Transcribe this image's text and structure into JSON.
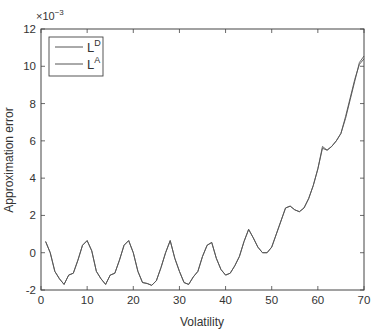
{
  "chart_data": {
    "type": "line",
    "title": "",
    "xlabel": "Volatility",
    "ylabel": "Approximation error",
    "y_multiplier_label": {
      "base": "×10",
      "exponent": "−3"
    },
    "xlim": [
      0,
      70
    ],
    "ylim": [
      -2,
      12
    ],
    "xticks": [
      0,
      10,
      20,
      30,
      40,
      50,
      60,
      70
    ],
    "yticks": [
      -2,
      0,
      2,
      4,
      6,
      8,
      10,
      12
    ],
    "grid": false,
    "legend_position": "top-left",
    "line_color": "#555555",
    "series": [
      {
        "name": "L",
        "superscript": "D",
        "x": [
          1,
          2,
          3,
          4,
          5,
          6,
          7,
          8,
          9,
          10,
          11,
          12,
          13,
          14,
          15,
          16,
          17,
          18,
          19,
          20,
          21,
          22,
          23,
          24,
          25,
          26,
          27,
          28,
          29,
          30,
          31,
          32,
          33,
          34,
          35,
          36,
          37,
          38,
          39,
          40,
          41,
          42,
          43,
          44,
          45,
          46,
          47,
          48,
          49,
          50,
          51,
          52,
          53,
          54,
          55,
          56,
          57,
          58,
          59,
          60,
          61,
          62,
          63,
          64,
          65,
          66,
          67,
          68,
          69,
          70
        ],
        "y": [
          0.6,
          0.0,
          -1.0,
          -1.4,
          -1.7,
          -1.2,
          -1.1,
          -0.4,
          0.4,
          0.65,
          0.1,
          -1.0,
          -1.4,
          -1.7,
          -1.2,
          -1.1,
          -0.4,
          0.4,
          0.65,
          0.0,
          -1.0,
          -1.6,
          -1.65,
          -1.75,
          -1.5,
          -0.8,
          0.0,
          0.65,
          -0.3,
          -1.0,
          -1.6,
          -1.7,
          -1.3,
          -1.0,
          -0.2,
          0.4,
          0.55,
          -0.3,
          -0.9,
          -1.2,
          -1.1,
          -0.7,
          -0.2,
          0.6,
          1.25,
          0.8,
          0.3,
          0.0,
          0.0,
          0.3,
          1.0,
          1.7,
          2.4,
          2.5,
          2.3,
          2.2,
          2.4,
          2.9,
          3.6,
          4.5,
          5.6,
          5.5,
          5.7,
          6.0,
          6.4,
          7.3,
          8.3,
          9.3,
          10.1,
          10.4
        ]
      },
      {
        "name": "L",
        "superscript": "A",
        "x": [
          1,
          2,
          3,
          4,
          5,
          6,
          7,
          8,
          9,
          10,
          11,
          12,
          13,
          14,
          15,
          16,
          17,
          18,
          19,
          20,
          21,
          22,
          23,
          24,
          25,
          26,
          27,
          28,
          29,
          30,
          31,
          32,
          33,
          34,
          35,
          36,
          37,
          38,
          39,
          40,
          41,
          42,
          43,
          44,
          45,
          46,
          47,
          48,
          49,
          50,
          51,
          52,
          53,
          54,
          55,
          56,
          57,
          58,
          59,
          60,
          61,
          62,
          63,
          64,
          65,
          66,
          67,
          68,
          69,
          70
        ],
        "y": [
          0.6,
          0.0,
          -1.0,
          -1.4,
          -1.7,
          -1.2,
          -1.1,
          -0.4,
          0.4,
          0.65,
          0.1,
          -1.0,
          -1.4,
          -1.7,
          -1.2,
          -1.1,
          -0.4,
          0.4,
          0.65,
          0.0,
          -1.0,
          -1.6,
          -1.65,
          -1.75,
          -1.5,
          -0.8,
          0.0,
          0.65,
          -0.3,
          -1.0,
          -1.6,
          -1.7,
          -1.3,
          -1.0,
          -0.2,
          0.4,
          0.55,
          -0.3,
          -0.9,
          -1.2,
          -1.1,
          -0.7,
          -0.2,
          0.6,
          1.25,
          0.8,
          0.3,
          0.0,
          0.0,
          0.3,
          1.0,
          1.7,
          2.4,
          2.5,
          2.3,
          2.2,
          2.4,
          2.9,
          3.6,
          4.5,
          5.7,
          5.5,
          5.7,
          6.0,
          6.4,
          7.2,
          8.2,
          9.2,
          10.2,
          10.55
        ]
      }
    ]
  }
}
